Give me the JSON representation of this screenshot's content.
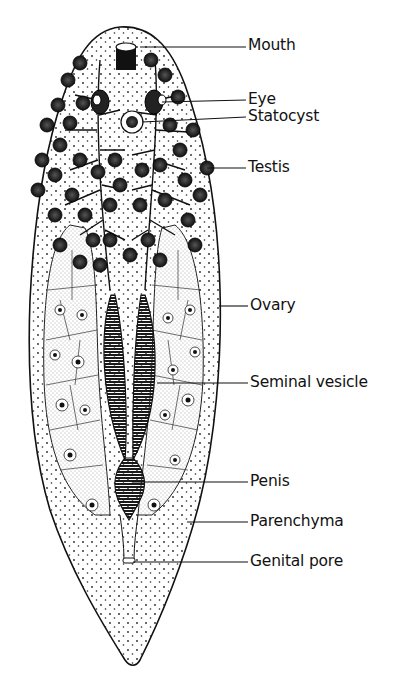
{
  "figure": {
    "labels": [
      {
        "id": "mouth",
        "text": "Mouth",
        "x": 248,
        "y": 38,
        "lineFrom": [
          140,
          47
        ]
      },
      {
        "id": "eye",
        "text": "Eye",
        "x": 248,
        "y": 92,
        "lineFrom": [
          162,
          102
        ]
      },
      {
        "id": "statocyst",
        "text": "Statocyst",
        "x": 248,
        "y": 108,
        "lineFrom": [
          142,
          122
        ]
      },
      {
        "id": "testis",
        "text": "Testis",
        "x": 248,
        "y": 160,
        "lineFrom": [
          207,
          168
        ]
      },
      {
        "id": "ovary",
        "text": "Ovary",
        "x": 250,
        "y": 299,
        "lineFrom": [
          219,
          306
        ]
      },
      {
        "id": "seminal-vesicle",
        "text": "Seminal vesicle",
        "x": 250,
        "y": 375,
        "lineFrom": [
          157,
          383
        ]
      },
      {
        "id": "penis",
        "text": "Penis",
        "x": 250,
        "y": 475,
        "lineFrom": [
          133,
          482
        ]
      },
      {
        "id": "parenchyma",
        "text": "Parenchyma",
        "x": 250,
        "y": 514,
        "lineFrom": [
          187,
          522
        ]
      },
      {
        "id": "genital-pore",
        "text": "Genital pore",
        "x": 250,
        "y": 554,
        "lineFrom": [
          133,
          562
        ]
      }
    ]
  }
}
